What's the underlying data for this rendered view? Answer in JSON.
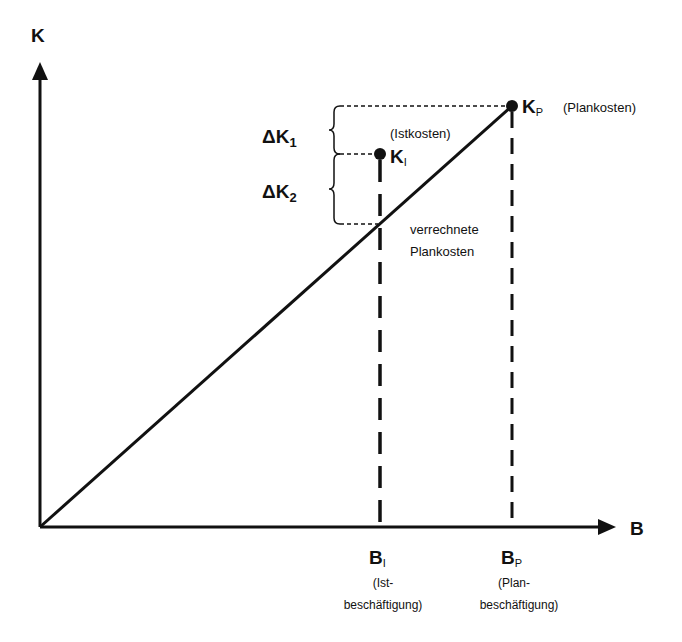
{
  "diagram": {
    "title": "",
    "axes": {
      "y_label": "K",
      "x_label": "B"
    },
    "points": {
      "plan_costs": {
        "symbol": "K",
        "subscript": "P",
        "annotation": "(Plankosten)"
      },
      "actual_costs": {
        "symbol": "K",
        "subscript": "I",
        "annotation": "(Istkosten)"
      }
    },
    "deltas": {
      "delta_k1": {
        "symbol": "ΔK",
        "subscript": "1"
      },
      "delta_k2": {
        "symbol": "ΔK",
        "subscript": "2"
      }
    },
    "line_label": {
      "line1": "verrechnete",
      "line2": "Plankosten"
    },
    "x_markers": {
      "actual": {
        "symbol": "B",
        "subscript": "I",
        "line1": "(Ist-",
        "line2": "beschäftigung)"
      },
      "plan": {
        "symbol": "B",
        "subscript": "P",
        "line1": "(Plan-",
        "line2": "beschäftigung)"
      }
    },
    "colors": {
      "ink": "#111111",
      "background": "#ffffff"
    }
  }
}
